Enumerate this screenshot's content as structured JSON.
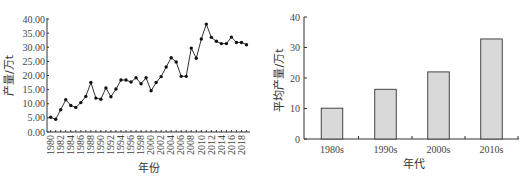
{
  "chart_data": [
    {
      "type": "line",
      "title": "",
      "xlabel": "年份",
      "ylabel": "产量/万t",
      "ylim": [
        0,
        40
      ],
      "yticks": [
        "0.00",
        "5.00",
        "10.00",
        "15.00",
        "20.00",
        "25.00",
        "30.00",
        "35.00",
        "40.00"
      ],
      "xticks": [
        "1980",
        "1982",
        "1984",
        "1986",
        "1988",
        "1990",
        "1992",
        "1994",
        "1996",
        "1998",
        "2000",
        "2002",
        "2004",
        "2006",
        "2008",
        "2010",
        "2012",
        "2014",
        "2016",
        "2018"
      ],
      "grid": false,
      "marker": "filled-circle",
      "x": [
        1980,
        1981,
        1982,
        1983,
        1984,
        1985,
        1986,
        1987,
        1988,
        1989,
        1990,
        1991,
        1992,
        1993,
        1994,
        1995,
        1996,
        1997,
        1998,
        1999,
        2000,
        2001,
        2002,
        2003,
        2004,
        2005,
        2006,
        2007,
        2008,
        2009,
        2010,
        2011,
        2012,
        2013,
        2014,
        2015,
        2016,
        2017,
        2018,
        2019
      ],
      "series": [
        {
          "name": "产量",
          "values": [
            5.2,
            4.5,
            7.9,
            11.4,
            9.4,
            8.7,
            10.4,
            12.6,
            17.5,
            12.0,
            11.6,
            15.6,
            12.5,
            15.2,
            18.4,
            18.4,
            17.7,
            19.2,
            17.1,
            19.2,
            14.6,
            17.5,
            19.6,
            23.0,
            26.3,
            24.8,
            19.7,
            19.7,
            29.7,
            26.1,
            32.9,
            38.2,
            33.5,
            32.1,
            31.3,
            31.3,
            33.6,
            31.7,
            31.7,
            30.9
          ]
        }
      ]
    },
    {
      "type": "bar",
      "title": "",
      "xlabel": "年代",
      "ylabel": "平均产量/万t",
      "ylim": [
        0,
        40
      ],
      "yticks": [
        "0",
        "10",
        "20",
        "30",
        "40"
      ],
      "grid": false,
      "categories": [
        "1980s",
        "1990s",
        "2000s",
        "2010s"
      ],
      "values": [
        10.1,
        16.3,
        22.0,
        32.8
      ],
      "bar_color": "#d9d9d9",
      "edge_color": "#333333"
    }
  ]
}
